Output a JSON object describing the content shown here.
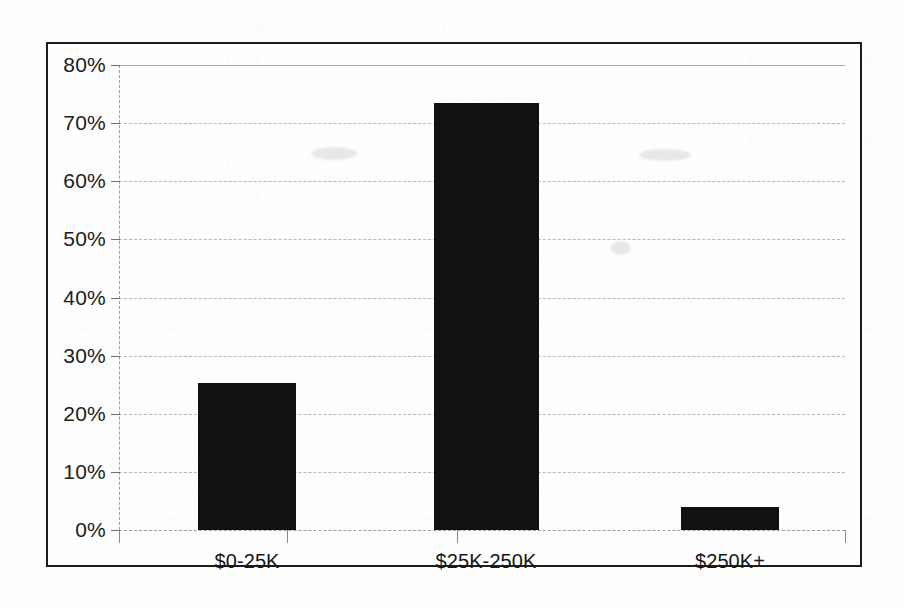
{
  "chart_data": {
    "type": "bar",
    "title": "",
    "subtitle": "",
    "xlabel": "",
    "ylabel": "",
    "categories": [
      "$0-25K",
      "$25K-250K",
      "$250K+"
    ],
    "values": [
      25.3,
      73.5,
      4.0
    ],
    "series": [
      {
        "name": "Share",
        "values": [
          25.3,
          73.5,
          4.0
        ]
      }
    ],
    "value_unit": "%",
    "ylim": [
      0,
      80
    ],
    "ytick_step": 10,
    "ytick_labels": [
      "0%",
      "10%",
      "20%",
      "30%",
      "40%",
      "50%",
      "60%",
      "70%",
      "80%"
    ],
    "ytick_values": [
      0,
      10,
      20,
      30,
      40,
      50,
      60,
      70,
      80
    ],
    "grid": "horizontal-dashed",
    "legend": "none",
    "annotations": [],
    "colors": {
      "bar": "#111111",
      "gridline": "#b7b7b4",
      "axis": "#9c9c99",
      "frame": "#1d1d1d",
      "text": "#202020",
      "background": "#fefefe"
    }
  }
}
